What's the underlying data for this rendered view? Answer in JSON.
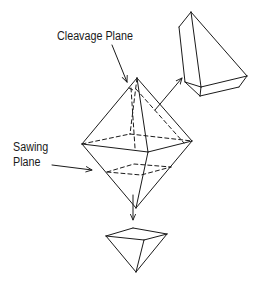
{
  "figure": {
    "labels": {
      "cleavage_plane": "Cleavage Plane",
      "sawing_plane_line1": "Sawing",
      "sawing_plane_line2": "Plane"
    },
    "parts": [
      {
        "name": "octahedron-crystal",
        "description": "Main octahedral crystal with dashed internal planes"
      },
      {
        "name": "cleaved-fragment",
        "description": "Fragment separated along cleavage plane (top right)"
      },
      {
        "name": "sawn-fragment",
        "description": "Pyramid piece separated by sawing plane (bottom)"
      }
    ],
    "colors": {
      "line": "#1a1a1a",
      "background": "#ffffff"
    }
  }
}
